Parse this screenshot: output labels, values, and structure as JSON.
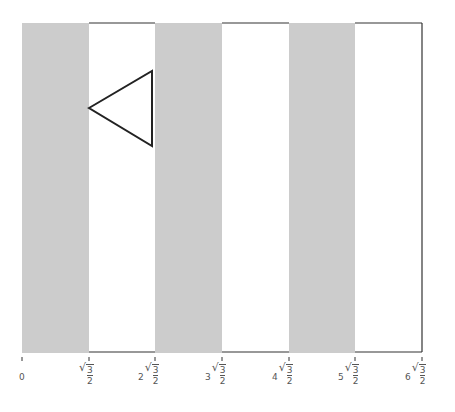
{
  "diagram": {
    "type": "striped-strip-with-triangle",
    "stripe_color": "#cccccc",
    "line_color": "#333333",
    "ticks": [
      {
        "coef": "0",
        "radicand": "",
        "denominator": "",
        "x": 22
      },
      {
        "coef": "",
        "radicand": "3",
        "denominator": "2",
        "x": 89
      },
      {
        "coef": "2",
        "radicand": "3",
        "denominator": "2",
        "x": 155
      },
      {
        "coef": "3",
        "radicand": "3",
        "denominator": "2",
        "x": 222
      },
      {
        "coef": "4",
        "radicand": "3",
        "denominator": "2",
        "x": 289
      },
      {
        "coef": "5",
        "radicand": "3",
        "denominator": "2",
        "x": 355
      },
      {
        "coef": "6",
        "radicand": "3",
        "denominator": "2",
        "x": 422
      }
    ],
    "triangle": {
      "points": "89,108 152,71 152,146"
    }
  }
}
